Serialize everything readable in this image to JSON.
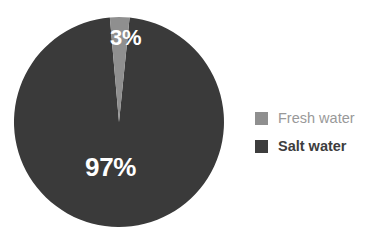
{
  "chart_data": {
    "type": "pie",
    "title": "",
    "categories": [
      "Fresh water",
      "Salt water"
    ],
    "values": [
      3,
      97
    ],
    "value_labels": [
      "3%",
      "97%"
    ],
    "units": "percent",
    "colors": [
      "#8f8f8f",
      "#3a3a3a"
    ],
    "legend_position": "right",
    "grid": false,
    "start_angle_deg": -5,
    "direction": "clockwise",
    "background": "#ffffff",
    "slices": [
      {
        "name": "Fresh water",
        "value": 3,
        "label": "3%",
        "color": "#8f8f8f",
        "label_color": "#ffffff"
      },
      {
        "name": "Salt water",
        "value": 97,
        "label": "97%",
        "color": "#3a3a3a",
        "label_color": "#ffffff"
      }
    ]
  },
  "legend": {
    "items": [
      {
        "label": "Fresh water",
        "swatch_color": "#8f8f8f",
        "text_color": "#999999"
      },
      {
        "label": "Salt water",
        "swatch_color": "#3d3d3d",
        "text_color": "#3d3d3d"
      }
    ]
  }
}
